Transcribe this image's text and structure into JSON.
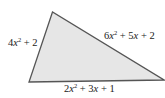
{
  "diagram": {
    "shape": "triangle",
    "fill_color": "#e6e6e6",
    "stroke_color": "#555555",
    "vertices": {
      "top": [
        52.5,
        12
      ],
      "bottom_left": [
        29,
        82
      ],
      "bottom_right": [
        164,
        80
      ]
    },
    "sides": {
      "left": {
        "label": "4x^2 + 2",
        "coef": "4",
        "var": "x",
        "exp": "2",
        "rest": " + 2"
      },
      "right": {
        "label": "6x^2 + 5x + 2",
        "coef": "6",
        "var": "x",
        "exp": "2",
        "rest_a": " + 5",
        "var2": "x",
        "rest_b": " + 2"
      },
      "bottom": {
        "label": "2x^2 + 3x + 1",
        "coef": "2",
        "var": "x",
        "exp": "2",
        "rest_a": " + 3",
        "var2": "x",
        "rest_b": " + 1"
      }
    }
  }
}
